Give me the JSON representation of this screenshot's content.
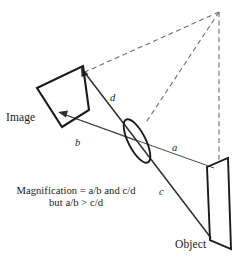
{
  "figure": {
    "kind": "optics-ray-diagram",
    "title_visible": false,
    "background_color": "#ffffff",
    "stroke_color": "#1a1a1a",
    "dashed_color": "#6b6b6b",
    "ray_color": "#3a3a3a",
    "width": 247,
    "height": 262
  },
  "labels": {
    "image_plane": "Image",
    "object_plane": "Object",
    "ray_a": "a",
    "ray_b": "b",
    "ray_c": "c",
    "ray_d": "d"
  },
  "annotation": {
    "line1": "Magnification = a/b and c/d",
    "line2": "but a/b > c/d"
  },
  "elements": {
    "image_plane_name": "image-plane-quadrilateral",
    "object_plane_name": "object-plane-parallelogram",
    "lens_name": "lens-ellipse",
    "apex_name": "scheimpflug-intersection-point"
  },
  "geometry": {
    "image_plane_points": "37,88 83,66 89,110 62,127",
    "object_plane_points": "207,167 228,158 231,249 210,240",
    "lens_center": [
      137,
      141
    ],
    "lens_rx": 8.5,
    "lens_ry": 24,
    "lens_rotation": -28,
    "apex": [
      219,
      12
    ],
    "ray_a": [
      [
        213,
        168
      ],
      [
        60,
        113
      ]
    ],
    "ray_b": [
      [
        137,
        141
      ],
      [
        60,
        113
      ]
    ],
    "ray_c": [
      [
        211,
        238
      ],
      [
        137,
        141
      ]
    ],
    "ray_d": [
      [
        137,
        141
      ],
      [
        84,
        74
      ]
    ],
    "dashed_apex_to_image": [
      [
        219,
        12
      ],
      [
        84,
        72
      ]
    ],
    "dashed_apex_to_lens": [
      [
        219,
        12
      ],
      [
        144,
        123
      ]
    ],
    "dashed_apex_vertical": [
      [
        219,
        12
      ],
      [
        219,
        162
      ]
    ]
  }
}
